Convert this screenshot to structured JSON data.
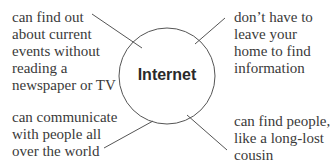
{
  "diagram": {
    "type": "concept-web",
    "center": {
      "label": "Internet"
    },
    "nodes": [
      {
        "position": "top-left",
        "lines": [
          "can find out",
          "about current",
          "events without",
          "reading a",
          "newspaper or TV"
        ]
      },
      {
        "position": "top-right",
        "lines": [
          "don’t have to",
          "leave your",
          "home to find",
          "information"
        ]
      },
      {
        "position": "bottom-left",
        "lines": [
          "can communicate",
          "with people all",
          "over the world"
        ]
      },
      {
        "position": "bottom-right",
        "lines": [
          "can find people,",
          "like a long-lost",
          "cousin"
        ]
      }
    ],
    "colors": {
      "line": "#555555",
      "text": "#3a3a3a",
      "background": "#ffffff"
    }
  }
}
